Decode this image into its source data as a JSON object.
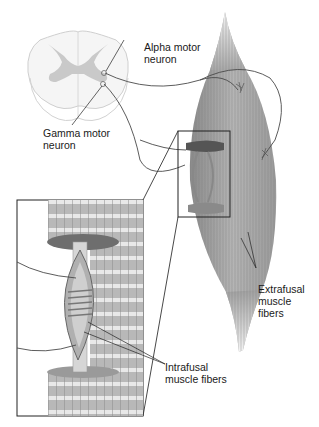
{
  "diagram": {
    "colors": {
      "background": "#ffffff",
      "spinal_white_matter": "#f4f4f4",
      "spinal_gray_matter": "#c9c9c9",
      "muscle_fiber": "#9a9a9a",
      "muscle_dark": "#6e6e6e",
      "nerve_line": "#4a4a4a",
      "label_text": "#1a1a1a"
    },
    "labels": {
      "alpha_motor_neuron": "Alpha motor\nneuron",
      "gamma_motor_neuron": "Gamma motor\nneuron",
      "extrafusal_muscle_fibers": "Extrafusal\nmuscle\nfibers",
      "intrafusal_muscle_fibers": "Intrafusal\nmuscle fibers"
    },
    "parts": [
      {
        "name": "spinal-cord-cross-section"
      },
      {
        "name": "skeletal-muscle"
      },
      {
        "name": "zoom-box"
      },
      {
        "name": "enlarged-muscle-spindle-inset"
      }
    ]
  }
}
